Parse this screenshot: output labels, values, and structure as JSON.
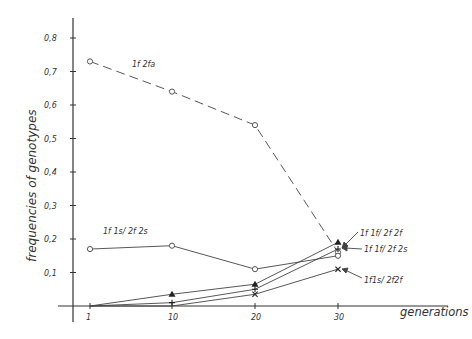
{
  "chart_data": {
    "type": "line",
    "title": "",
    "xlabel": "generations",
    "ylabel": "frequencies of genotypes",
    "x": [
      1,
      10,
      20,
      30
    ],
    "xticks": [
      "1",
      "10",
      "20",
      "30"
    ],
    "yticks": [
      "0,1",
      "0,2",
      "0,3",
      "0,4",
      "0,5",
      "0,6",
      "0,7",
      "0,8"
    ],
    "ylim": [
      0,
      0.8
    ],
    "grid": false,
    "series": [
      {
        "name": "1f 2fa",
        "marker": "circle",
        "line": "dashed",
        "values": [
          0.73,
          0.64,
          0.54,
          0.16
        ]
      },
      {
        "name": "1f 1s/ 2f 2s",
        "marker": "circle",
        "line": "solid",
        "values": [
          0.17,
          0.18,
          0.11,
          0.15
        ]
      },
      {
        "name": "1f 1f/ 2f 2f",
        "marker": "triangle",
        "line": "solid",
        "values": [
          0.0,
          0.035,
          0.065,
          0.19
        ]
      },
      {
        "name": "1f 1f/ 2f 2s",
        "marker": "plus",
        "line": "solid",
        "values": [
          0.0,
          0.01,
          0.05,
          0.17
        ]
      },
      {
        "name": "1f1s/ 2f2f",
        "marker": "cross",
        "line": "solid",
        "values": [
          0.0,
          0.0,
          0.035,
          0.11
        ]
      }
    ],
    "annotations": [
      "1f 2fa",
      "1f 1s/ 2f 2s",
      "1f 1f/ 2f 2f",
      "1f 1f/ 2f 2s",
      "1f1s/ 2f2f"
    ]
  }
}
